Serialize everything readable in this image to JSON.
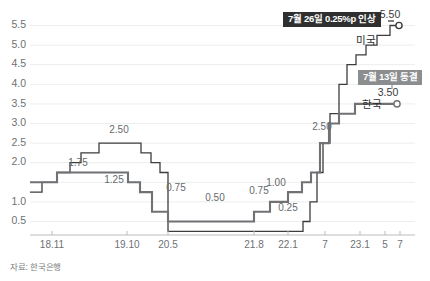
{
  "source_note": "자료: 한국은행",
  "annotations": {
    "us_badge": "7월 26일 0.25%p 인상",
    "kr_badge": "7월 13일 동결"
  },
  "chart_data": {
    "type": "line",
    "subtype": "step",
    "title": "",
    "xlabel": "",
    "ylabel": "",
    "ylim": [
      0.2,
      5.75
    ],
    "grid": true,
    "legend_position": "inline-endpoint",
    "y_ticks": [
      "5.5",
      "5.0",
      "4.5",
      "4.0",
      "3.5",
      "3.0",
      "2.5",
      "2.0",
      "1.5",
      "1.0",
      "0.5"
    ],
    "y_tick_values": [
      5.5,
      5.0,
      4.5,
      4.0,
      3.5,
      3.0,
      2.5,
      2.0,
      1.5,
      1.0,
      0.5
    ],
    "y_tick_hidden": [
      "1.5"
    ],
    "x_ticks": [
      "18.11",
      "19.10",
      "20.5",
      "21.8",
      "22.1",
      "7",
      "23.1",
      "5",
      "7"
    ],
    "x_tick_positions": [
      52,
      127,
      168,
      254,
      288,
      325,
      360,
      385,
      400
    ],
    "series": [
      {
        "name": "미국",
        "color": "#3d3d3d",
        "width": 1.3,
        "end_value": "5.50",
        "end_marker": "circle",
        "steps": [
          {
            "x": 30,
            "v": 1.25
          },
          {
            "x": 42,
            "v": 1.5
          },
          {
            "x": 57,
            "v": 1.75
          },
          {
            "x": 70,
            "v": 2.0
          },
          {
            "x": 81,
            "v": 2.25
          },
          {
            "x": 99,
            "v": 2.5
          },
          {
            "x": 141,
            "v": 2.25
          },
          {
            "x": 151,
            "v": 2.0
          },
          {
            "x": 160,
            "v": 1.75
          },
          {
            "x": 168,
            "v": 0.25
          },
          {
            "x": 303,
            "v": 0.5
          },
          {
            "x": 310,
            "v": 1.0
          },
          {
            "x": 317,
            "v": 1.75
          },
          {
            "x": 323,
            "v": 2.5
          },
          {
            "x": 330,
            "v": 3.25
          },
          {
            "x": 339,
            "v": 4.0
          },
          {
            "x": 347,
            "v": 4.5
          },
          {
            "x": 356,
            "v": 4.75
          },
          {
            "x": 366,
            "v": 5.0
          },
          {
            "x": 377,
            "v": 5.25
          },
          {
            "x": 390,
            "v": 5.5
          },
          {
            "x": 396,
            "v": 5.5
          }
        ]
      },
      {
        "name": "한국",
        "color": "#6f7174",
        "width": 2.1,
        "end_value": "3.50",
        "end_marker": "circle",
        "steps": [
          {
            "x": 30,
            "v": 1.5
          },
          {
            "x": 57,
            "v": 1.75
          },
          {
            "x": 128,
            "v": 1.5
          },
          {
            "x": 140,
            "v": 1.25
          },
          {
            "x": 152,
            "v": 0.75
          },
          {
            "x": 168,
            "v": 0.5
          },
          {
            "x": 254,
            "v": 0.75
          },
          {
            "x": 270,
            "v": 1.0
          },
          {
            "x": 288,
            "v": 1.25
          },
          {
            "x": 302,
            "v": 1.5
          },
          {
            "x": 311,
            "v": 1.75
          },
          {
            "x": 320,
            "v": 2.5
          },
          {
            "x": 329,
            "v": 3.0
          },
          {
            "x": 339,
            "v": 3.25
          },
          {
            "x": 355,
            "v": 3.5
          },
          {
            "x": 394,
            "v": 3.5
          }
        ]
      }
    ],
    "point_labels": [
      {
        "text": "2.50",
        "x": 119,
        "y": 133,
        "series": "미국"
      },
      {
        "text": "1.75",
        "x": 78,
        "y": 166,
        "series": "한국"
      },
      {
        "text": "1.25",
        "x": 114,
        "y": 183,
        "series": "한국"
      },
      {
        "text": "0.75",
        "x": 176,
        "y": 191,
        "series": "한국"
      },
      {
        "text": "0.50",
        "x": 215,
        "y": 201,
        "series": "한국"
      },
      {
        "text": "0.75",
        "x": 259,
        "y": 194,
        "series": "한국"
      },
      {
        "text": "1.00",
        "x": 276,
        "y": 186,
        "series": "한국"
      },
      {
        "text": "0.25",
        "x": 288,
        "y": 211,
        "series": "미국"
      },
      {
        "text": "2.50",
        "x": 322,
        "y": 130,
        "series": "한국"
      }
    ]
  }
}
